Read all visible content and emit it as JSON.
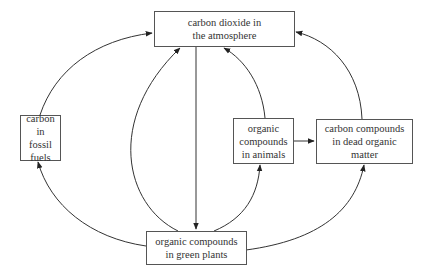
{
  "diagram": {
    "nodes": {
      "atmosphere": {
        "label": "carbon dioxide in\nthe atmosphere"
      },
      "fossil": {
        "label": "carbon\nin fossil\nfuels"
      },
      "animals": {
        "label": "organic\ncompounds\nin animals"
      },
      "dead": {
        "label": "carbon compounds\nin dead organic\nmatter"
      },
      "plants": {
        "label": "organic compounds\nin green plants"
      }
    },
    "edges": [
      {
        "from": "fossil",
        "to": "atmosphere"
      },
      {
        "from": "plants",
        "to": "fossil"
      },
      {
        "from": "plants",
        "to": "atmosphere"
      },
      {
        "from": "atmosphere",
        "to": "plants"
      },
      {
        "from": "animals",
        "to": "atmosphere"
      },
      {
        "from": "plants",
        "to": "animals"
      },
      {
        "from": "animals",
        "to": "dead"
      },
      {
        "from": "dead",
        "to": "atmosphere"
      },
      {
        "from": "plants",
        "to": "dead"
      }
    ],
    "colors": {
      "line": "#333333",
      "box_border": "#555555",
      "text": "#333333"
    }
  }
}
